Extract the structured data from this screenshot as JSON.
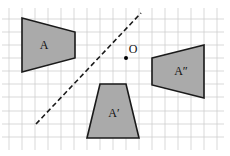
{
  "figure": {
    "colors": {
      "grid": "#cfcfcf",
      "shape_fill": "#aaaaaa",
      "shape_stroke": "#1a1a1a",
      "dashed_line": "#1a1a1a",
      "point": "#000000"
    },
    "grid": {
      "spacing_px": 13,
      "vertical_x": [
        9,
        22,
        35,
        48,
        61,
        74,
        87,
        100,
        113,
        126,
        139,
        152,
        165,
        178,
        191,
        204,
        217
      ],
      "horizontal_y": [
        19,
        32,
        45,
        58,
        71,
        84,
        97,
        111,
        124,
        137
      ],
      "extent": {
        "x1": 2,
        "x2": 224,
        "y1": 8,
        "y2": 150
      }
    },
    "shapes": [
      {
        "id": "A",
        "label": "A",
        "points": [
          [
            22,
            18
          ],
          [
            75,
            32
          ],
          [
            75,
            58
          ],
          [
            22,
            72
          ]
        ],
        "label_pos": [
          44,
          45
        ]
      },
      {
        "id": "A-prime",
        "label": "A′",
        "points": [
          [
            100,
            84
          ],
          [
            126,
            84
          ],
          [
            139,
            138
          ],
          [
            87,
            138
          ]
        ],
        "label_pos": [
          114,
          113
        ]
      },
      {
        "id": "A-double-prime",
        "label": "A″",
        "points": [
          [
            152,
            58
          ],
          [
            204,
            45
          ],
          [
            204,
            98
          ],
          [
            152,
            85
          ]
        ],
        "label_pos": [
          181,
          71
        ]
      }
    ],
    "mirror_line": {
      "x1": 36,
      "y1": 124,
      "x2": 141,
      "y2": 13,
      "style": "dashed"
    },
    "center_point": {
      "label": "O",
      "x": 126,
      "y": 58,
      "label_pos": [
        133,
        49
      ]
    }
  }
}
